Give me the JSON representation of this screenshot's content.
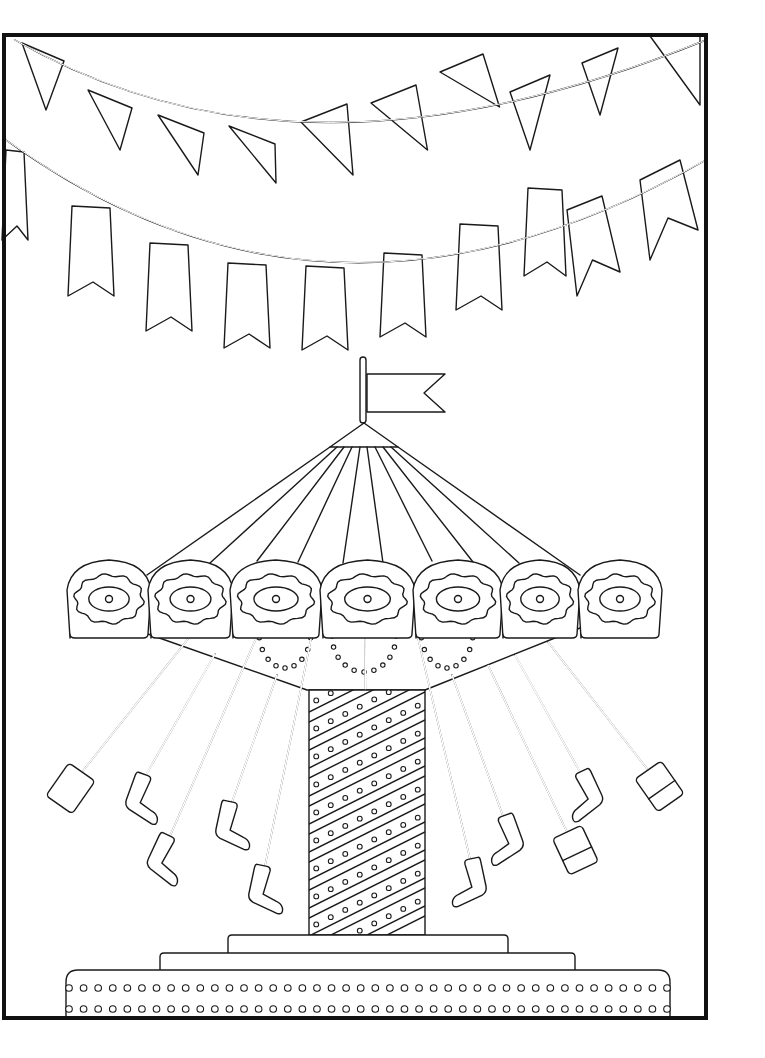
{
  "page": {
    "title": "Swing carousel coloring page",
    "background": "#ffffff",
    "line_color": "#1a1a1a",
    "frame": {
      "x": 4,
      "y": 35,
      "w": 702,
      "h": 983,
      "stroke": "#111111"
    }
  },
  "bunting": [
    {
      "name": "upper-garland",
      "rope": {
        "x1": 15,
        "y1": 40,
        "cx": 300,
        "cy": 205,
        "x2": 706,
        "y2": 40
      },
      "flag_style": "triangle",
      "flags": [
        {
          "x": 22,
          "y": 43,
          "w": 42,
          "tip_x": 25,
          "tip_y": 110
        },
        {
          "x": 88,
          "y": 90,
          "w": 44,
          "tip_x": 98,
          "tip_y": 150
        },
        {
          "x": 158,
          "y": 115,
          "w": 46,
          "tip_x": 175,
          "tip_y": 175
        },
        {
          "x": 229,
          "y": 126,
          "w": 46,
          "tip_x": 253,
          "tip_y": 183
        },
        {
          "x": 301,
          "y": 122,
          "w": 46,
          "tip_x": 330,
          "tip_y": 175
        },
        {
          "x": 371,
          "y": 103,
          "w": 45,
          "tip_x": 405,
          "tip_y": 150
        },
        {
          "x": 440,
          "y": 72,
          "w": 43,
          "tip_x": 478,
          "tip_y": 107
        }
      ]
    },
    {
      "name": "lower-garland",
      "rope": {
        "x1": 6,
        "y1": 140,
        "cx": 330,
        "cy": 375,
        "x2": 706,
        "y2": 160
      },
      "flag_style": "swallowtail",
      "flags": [
        {
          "x": 6,
          "y": 150,
          "w": 18,
          "h": 90
        },
        {
          "x": 72,
          "y": 206,
          "w": 38,
          "h": 90
        },
        {
          "x": 150,
          "y": 243,
          "w": 38,
          "h": 88
        },
        {
          "x": 228,
          "y": 263,
          "w": 38,
          "h": 85
        },
        {
          "x": 306,
          "y": 266,
          "w": 38,
          "h": 84
        },
        {
          "x": 384,
          "y": 253,
          "w": 38,
          "h": 84
        },
        {
          "x": 460,
          "y": 224,
          "w": 38,
          "h": 86
        },
        {
          "x": 528,
          "y": 188,
          "w": 34,
          "h": 88
        }
      ]
    }
  ],
  "carousel": {
    "flag": {
      "pole_x": 363,
      "pole_top": 357,
      "pole_bottom": 423,
      "flag_x1": 367,
      "flag_y1": 374,
      "flag_x2": 445,
      "flag_y2": 412,
      "notch_x": 424
    },
    "cone": {
      "apex_x": 364,
      "apex_y": 423,
      "base_left": 330,
      "base_right": 398,
      "base_y": 447
    },
    "canopy_ribs": [
      {
        "x1": 330,
        "y1": 447,
        "x2": 147,
        "y2": 575
      },
      {
        "x1": 337,
        "y1": 447,
        "x2": 210,
        "y2": 563
      },
      {
        "x1": 344,
        "y1": 447,
        "x2": 257,
        "y2": 561
      },
      {
        "x1": 352,
        "y1": 447,
        "x2": 298,
        "y2": 562
      },
      {
        "x1": 360,
        "y1": 447,
        "x2": 343,
        "y2": 563
      },
      {
        "x1": 367,
        "y1": 447,
        "x2": 383,
        "y2": 563
      },
      {
        "x1": 375,
        "y1": 447,
        "x2": 432,
        "y2": 561
      },
      {
        "x1": 383,
        "y1": 447,
        "x2": 473,
        "y2": 562
      },
      {
        "x1": 391,
        "y1": 447,
        "x2": 519,
        "y2": 563
      },
      {
        "x1": 398,
        "y1": 447,
        "x2": 580,
        "y2": 575
      }
    ],
    "panels": [
      {
        "x": 67,
        "y": 560,
        "w": 84,
        "h": 78
      },
      {
        "x": 148,
        "y": 560,
        "w": 85,
        "h": 78
      },
      {
        "x": 230,
        "y": 560,
        "w": 92,
        "h": 78
      },
      {
        "x": 320,
        "y": 560,
        "w": 95,
        "h": 78
      },
      {
        "x": 413,
        "y": 560,
        "w": 90,
        "h": 78
      },
      {
        "x": 500,
        "y": 560,
        "w": 80,
        "h": 78
      },
      {
        "x": 578,
        "y": 560,
        "w": 84,
        "h": 78
      }
    ],
    "underside": {
      "left_x": 148,
      "left_y": 634,
      "center_left_x": 307,
      "center_right_x": 425,
      "bottom_y": 690,
      "right_x": 580,
      "right_y": 628
    },
    "column": {
      "x": 309,
      "y": 690,
      "w": 116,
      "h": 245,
      "stripe_count": 9
    },
    "base_tiers": [
      {
        "x": 228,
        "y": 935,
        "w": 280,
        "h": 20
      },
      {
        "x": 160,
        "y": 953,
        "w": 415,
        "h": 19
      },
      {
        "x": 66,
        "y": 970,
        "w": 604,
        "h": 48
      }
    ],
    "base_dot_rows": 2,
    "base_dot_columns": 42,
    "swings": [
      {
        "x1": 192,
        "y1": 634,
        "x2": 82,
        "y2": 772,
        "seat": "box",
        "angle": 35
      },
      {
        "x1": 215,
        "y1": 654,
        "x2": 146,
        "y2": 775,
        "seat": "chair",
        "angle": 20
      },
      {
        "x1": 258,
        "y1": 634,
        "x2": 170,
        "y2": 836,
        "seat": "chair",
        "angle": 25
      },
      {
        "x1": 277,
        "y1": 675,
        "x2": 232,
        "y2": 802,
        "seat": "chair",
        "angle": 12
      },
      {
        "x1": 312,
        "y1": 634,
        "x2": 265,
        "y2": 866,
        "seat": "chair",
        "angle": 12
      },
      {
        "x1": 365,
        "y1": 634,
        "x2": 367,
        "y2": 880,
        "seat": "chair",
        "angle": 0
      },
      {
        "x1": 417,
        "y1": 634,
        "x2": 470,
        "y2": 859,
        "seat": "chair-mirror",
        "angle": -12
      },
      {
        "x1": 452,
        "y1": 675,
        "x2": 503,
        "y2": 816,
        "seat": "chair-mirror",
        "angle": -20
      },
      {
        "x1": 488,
        "y1": 665,
        "x2": 567,
        "y2": 832,
        "seat": "box-band",
        "angle": -25
      },
      {
        "x1": 515,
        "y1": 655,
        "x2": 580,
        "y2": 772,
        "seat": "chair-mirror",
        "angle": -25
      },
      {
        "x1": 548,
        "y1": 642,
        "x2": 648,
        "y2": 770,
        "seat": "box-band",
        "angle": -35
      }
    ]
  }
}
